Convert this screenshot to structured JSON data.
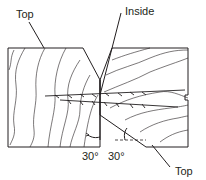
{
  "diagram": {
    "labels": {
      "top_left": "Top",
      "inside": "Inside",
      "angle_left": "30°",
      "angle_right": "30°",
      "top_bottom_right": "Top"
    },
    "colors": {
      "line": "#231f20",
      "background": "#ffffff"
    }
  }
}
